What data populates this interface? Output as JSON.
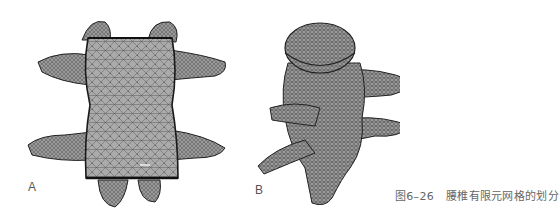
{
  "figure": {
    "panels": [
      {
        "id": "A",
        "label": "A",
        "view": "lumbar vertebra finite element mesh, anterior view"
      },
      {
        "id": "B",
        "label": "B",
        "view": "lumbar vertebra finite element mesh, oblique posterior view"
      }
    ],
    "caption": {
      "number": "图6–26",
      "text": "腰椎有限元网格的划分"
    },
    "colors": {
      "mesh_fill": "#a8a8a8",
      "mesh_line": "#3a3a3a",
      "background": "#ffffff",
      "caption_text": "#666666"
    }
  }
}
